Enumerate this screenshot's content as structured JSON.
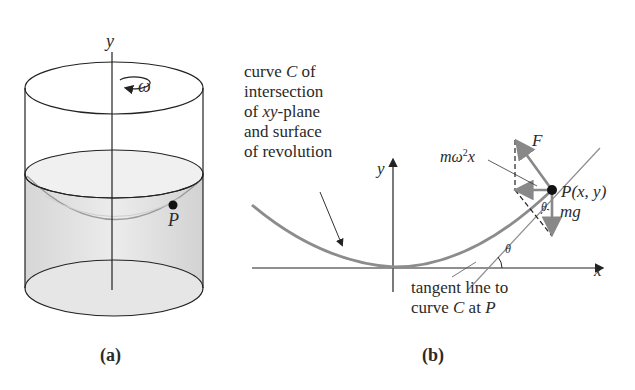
{
  "panel_a": {
    "caption": "(a)",
    "axis_label": "y",
    "rotation_label": "ω",
    "point_label": "P"
  },
  "panel_b": {
    "caption": "(b)",
    "curve_note_lines": [
      "curve C of",
      "intersection",
      "of xy-plane",
      "and surface",
      "of revolution"
    ],
    "y_axis_label": "y",
    "x_axis_label": "x",
    "force_F_label": "F",
    "centripetal_label": "mω²x",
    "point_label": "P(x, y)",
    "gravity_label": "mg",
    "angle_label_top": "θ",
    "angle_label_bottom": "θ",
    "tangent_note_lines": [
      "tangent line to",
      "curve C at P"
    ]
  },
  "colors": {
    "line": "#222222",
    "curve": "#8c8c8c",
    "liquid": "#dcdcdc",
    "liquid_light": "#efefef"
  }
}
